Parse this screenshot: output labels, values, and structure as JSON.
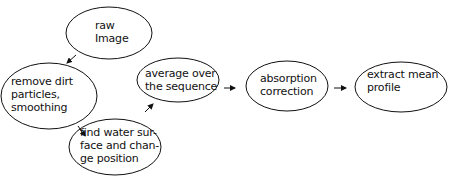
{
  "diagram": {
    "type": "flowchart",
    "nodes": [
      {
        "id": "raw",
        "lines": [
          "raw",
          "Image"
        ],
        "cx": 109,
        "cy": 33,
        "rx": 43,
        "ry": 26,
        "tx": 95,
        "ty": 19
      },
      {
        "id": "remove",
        "lines": [
          "remove dirt",
          "particles,",
          "smoothing"
        ],
        "cx": 49,
        "cy": 96,
        "rx": 48,
        "ry": 33,
        "tx": 11,
        "ty": 75
      },
      {
        "id": "find",
        "lines": [
          "find water sur-",
          "face and chan-",
          "ge position"
        ],
        "cx": 115,
        "cy": 147,
        "rx": 46,
        "ry": 28,
        "tx": 80,
        "ty": 126
      },
      {
        "id": "average",
        "lines": [
          "average over",
          "the sequence"
        ],
        "cx": 178,
        "cy": 80,
        "rx": 41,
        "ry": 22,
        "tx": 145,
        "ty": 67
      },
      {
        "id": "absorption",
        "lines": [
          "absorption",
          "correction"
        ],
        "cx": 287,
        "cy": 86,
        "rx": 41,
        "ry": 25,
        "tx": 260,
        "ty": 72
      },
      {
        "id": "extract",
        "lines": [
          "extract mean",
          "profile"
        ],
        "cx": 401,
        "cy": 87,
        "rx": 46,
        "ry": 25,
        "tx": 367,
        "ty": 68
      }
    ],
    "edges": [
      {
        "from": "raw",
        "to": "remove",
        "x1": 76,
        "y1": 55,
        "x2": 67,
        "y2": 63
      },
      {
        "from": "remove",
        "to": "find",
        "x1": 78,
        "y1": 126,
        "x2": 85,
        "y2": 136
      },
      {
        "from": "find",
        "to": "average",
        "x1": 145,
        "y1": 112,
        "x2": 153,
        "y2": 104
      },
      {
        "from": "average",
        "to": "absorption",
        "x1": 224,
        "y1": 88,
        "x2": 235,
        "y2": 88
      },
      {
        "from": "absorption",
        "to": "extract",
        "x1": 334,
        "y1": 88,
        "x2": 346,
        "y2": 88
      }
    ]
  }
}
